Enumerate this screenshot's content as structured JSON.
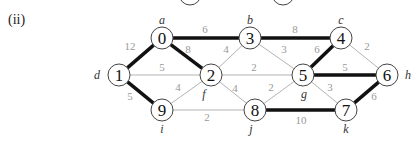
{
  "part_label": "(ii)",
  "colors": {
    "thin_edge": "#aaaaaa",
    "thick_edge": "#111111",
    "node_stroke": "#444444",
    "weight_text": "#999999",
    "letter_text": "#333333"
  },
  "partial_nodes": [
    {
      "x": 190,
      "y": -6
    },
    {
      "x": 283,
      "y": -6
    }
  ],
  "nodes": [
    {
      "id": "0",
      "x": 162,
      "y": 38,
      "letter": "a",
      "lx": 162,
      "ly": 24
    },
    {
      "id": "3",
      "x": 250,
      "y": 38,
      "letter": "b",
      "lx": 250,
      "ly": 24
    },
    {
      "id": "4",
      "x": 341,
      "y": 38,
      "letter": "c",
      "lx": 341,
      "ly": 24
    },
    {
      "id": "1",
      "x": 119,
      "y": 75,
      "letter": "d",
      "lx": 97,
      "ly": 79
    },
    {
      "id": "2",
      "x": 211,
      "y": 75,
      "letter": "f",
      "lx": 204,
      "ly": 98
    },
    {
      "id": "5",
      "x": 303,
      "y": 75,
      "letter": "g",
      "lx": 304,
      "ly": 98
    },
    {
      "id": "6",
      "x": 387,
      "y": 75,
      "letter": "h",
      "lx": 408,
      "ly": 79
    },
    {
      "id": "9",
      "x": 162,
      "y": 110,
      "letter": "i",
      "lx": 162,
      "ly": 133
    },
    {
      "id": "8",
      "x": 255,
      "y": 110,
      "letter": "j",
      "lx": 251,
      "ly": 133
    },
    {
      "id": "7",
      "x": 346,
      "y": 110,
      "letter": "k",
      "lx": 346,
      "ly": 133
    }
  ],
  "edges": [
    {
      "a": "0",
      "b": "3",
      "w": "6",
      "thick": true,
      "wx": 205,
      "wy": 33
    },
    {
      "a": "3",
      "b": "4",
      "w": "8",
      "thick": true,
      "wx": 295,
      "wy": 33
    },
    {
      "a": "0",
      "b": "1",
      "w": "12",
      "thick": true,
      "wx": 130,
      "wy": 50
    },
    {
      "a": "0",
      "b": "2",
      "w": "8",
      "thick": true,
      "wx": 188,
      "wy": 53
    },
    {
      "a": "3",
      "b": "2",
      "w": "4",
      "thick": false,
      "wx": 226,
      "wy": 53
    },
    {
      "a": "3",
      "b": "5",
      "w": "3",
      "thick": false,
      "wx": 284,
      "wy": 53
    },
    {
      "a": "4",
      "b": "5",
      "w": "6",
      "thick": true,
      "wx": 317,
      "wy": 53
    },
    {
      "a": "4",
      "b": "6",
      "w": "2",
      "thick": false,
      "wx": 367,
      "wy": 50
    },
    {
      "a": "1",
      "b": "2",
      "w": "5",
      "thick": false,
      "wx": 162,
      "wy": 71
    },
    {
      "a": "2",
      "b": "5",
      "w": "2",
      "thick": false,
      "wx": 254,
      "wy": 71
    },
    {
      "a": "5",
      "b": "6",
      "w": "5",
      "thick": true,
      "wx": 345,
      "wy": 71
    },
    {
      "a": "1",
      "b": "9",
      "w": "5",
      "thick": true,
      "wx": 130,
      "wy": 100
    },
    {
      "a": "9",
      "b": "2",
      "w": "4",
      "thick": false,
      "wx": 178,
      "wy": 91
    },
    {
      "a": "2",
      "b": "8",
      "w": "4",
      "thick": false,
      "wx": 235,
      "wy": 92
    },
    {
      "a": "8",
      "b": "5",
      "w": "2",
      "thick": false,
      "wx": 271,
      "wy": 91
    },
    {
      "a": "5",
      "b": "7",
      "w": "3",
      "thick": false,
      "wx": 330,
      "wy": 91
    },
    {
      "a": "6",
      "b": "7",
      "w": "6",
      "thick": true,
      "wx": 374,
      "wy": 100
    },
    {
      "a": "9",
      "b": "8",
      "w": "2",
      "thick": false,
      "wx": 207,
      "wy": 121
    },
    {
      "a": "8",
      "b": "7",
      "w": "10",
      "thick": true,
      "wx": 301,
      "wy": 124
    }
  ]
}
